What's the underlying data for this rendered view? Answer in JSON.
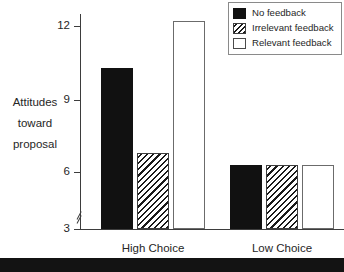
{
  "chart_data": {
    "type": "bar",
    "title": "",
    "xlabel": "",
    "ylabel": "Attitudes toward proposal",
    "ylabel_lines": [
      "Attitudes",
      "toward",
      "proposal"
    ],
    "categories": [
      "High Choice",
      "Low Choice"
    ],
    "series": [
      {
        "name": "No feedback",
        "values": [
          10.3,
          6.3
        ],
        "fill": "solid"
      },
      {
        "name": "Irrelevant feedback",
        "values": [
          6.8,
          6.3
        ],
        "fill": "hatch"
      },
      {
        "name": "Relevant feedback",
        "values": [
          12.2,
          6.3
        ],
        "fill": "open"
      }
    ],
    "ylim": [
      3,
      12.6
    ],
    "yticks": [
      3,
      6,
      9,
      12
    ],
    "ytick_labels": [
      "3",
      "6",
      "9",
      "12"
    ],
    "axis_break": true,
    "axis_break_note": "y-axis broken between 3 and 6",
    "grid": false,
    "legend_position": "top-right"
  },
  "axis": {
    "tick_labels": [
      "12",
      "9",
      "6",
      "3"
    ]
  },
  "ylabel": {
    "line1": "Attitudes",
    "line2": "toward",
    "line3": "proposal"
  },
  "groups": [
    {
      "label": "High Choice"
    },
    {
      "label": "Low Choice"
    }
  ],
  "legend": {
    "items": [
      {
        "label": "No feedback"
      },
      {
        "label": "Irrelevant feedback"
      },
      {
        "label": "Relevant feedback"
      }
    ]
  },
  "caption_band": {
    "text": ""
  },
  "colors": {
    "solid_fill": "#111111",
    "hatch_line": "#1a1a1a",
    "open_fill": "#ffffff",
    "axis": "#3d3d3d",
    "text": "#262626",
    "legend_border": "#8a8a8a",
    "band": "#131313"
  }
}
